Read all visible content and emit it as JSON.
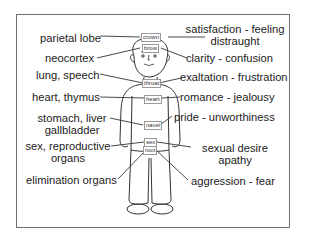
{
  "left_labels": [
    {
      "id": "parietal",
      "text": "parietal lobe"
    },
    {
      "id": "neocortex",
      "text": "neocortex"
    },
    {
      "id": "lung",
      "text": "lung, speech"
    },
    {
      "id": "heart",
      "text": "heart, thymus"
    },
    {
      "id": "stomach",
      "line1": "stomach, liver",
      "line2": "gallbladder"
    },
    {
      "id": "sex",
      "line1": "sex, reproductive",
      "line2": "organs"
    },
    {
      "id": "elimination",
      "text": "elimination organs"
    }
  ],
  "right_labels": [
    {
      "id": "satisfaction",
      "line1": "satisfaction - feeling",
      "line2": "distraught"
    },
    {
      "id": "clarity",
      "text": "clarity - confusion"
    },
    {
      "id": "exaltation",
      "text": "exaltation - frustration"
    },
    {
      "id": "romance",
      "text": "romance - jealousy"
    },
    {
      "id": "pride",
      "text": "pride - unworthiness"
    },
    {
      "id": "sexual",
      "line1": "sexual desire",
      "line2": "apathy"
    },
    {
      "id": "aggression",
      "text": "aggression - fear"
    }
  ],
  "chakra_tags": [
    "crown",
    "brow",
    "throat",
    "heart",
    "navel",
    "sex",
    "root"
  ]
}
